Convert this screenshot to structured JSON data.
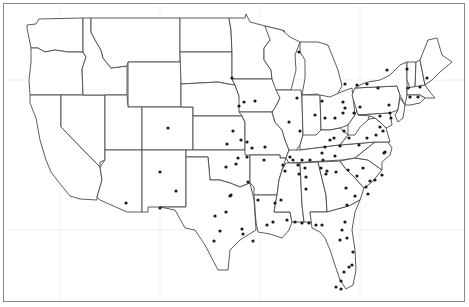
{
  "map": {
    "title": "",
    "region": "Contiguous United States",
    "frame_color": "#8a8a8a",
    "border_color": "#4a4a4a",
    "dot_color": "#1a1a1a",
    "background": "#ffffff",
    "dots": [
      [
        232,
        78
      ],
      [
        244,
        102
      ],
      [
        255,
        101
      ],
      [
        239,
        106
      ],
      [
        233,
        131
      ],
      [
        227,
        144
      ],
      [
        168,
        128
      ],
      [
        241,
        140
      ],
      [
        238,
        158
      ],
      [
        247,
        157
      ],
      [
        236,
        164
      ],
      [
        247,
        142
      ],
      [
        264,
        160
      ],
      [
        299,
        52
      ],
      [
        297,
        98
      ],
      [
        300,
        131
      ],
      [
        289,
        122
      ],
      [
        322,
        101
      ],
      [
        315,
        115
      ],
      [
        325,
        118
      ],
      [
        335,
        118
      ],
      [
        345,
        84
      ],
      [
        357,
        85
      ],
      [
        367,
        84
      ],
      [
        387,
        70
      ],
      [
        378,
        88
      ],
      [
        407,
        69
      ],
      [
        408,
        88
      ],
      [
        420,
        87
      ],
      [
        427,
        78
      ],
      [
        410,
        97
      ],
      [
        418,
        97
      ],
      [
        389,
        105
      ],
      [
        390,
        113
      ],
      [
        380,
        116
      ],
      [
        391,
        118
      ],
      [
        360,
        107
      ],
      [
        343,
        102
      ],
      [
        345,
        108
      ],
      [
        354,
        113
      ],
      [
        330,
        140
      ],
      [
        334,
        138
      ],
      [
        325,
        147
      ],
      [
        322,
        153
      ],
      [
        335,
        156
      ],
      [
        340,
        146
      ],
      [
        344,
        131
      ],
      [
        343,
        113
      ],
      [
        349,
        138
      ],
      [
        359,
        145
      ],
      [
        367,
        138
      ],
      [
        376,
        135
      ],
      [
        380,
        127
      ],
      [
        383,
        131
      ],
      [
        385,
        152
      ],
      [
        384,
        153
      ],
      [
        323,
        160
      ],
      [
        310,
        160
      ],
      [
        302,
        160
      ],
      [
        293,
        160
      ],
      [
        305,
        168
      ],
      [
        321,
        168
      ],
      [
        327,
        171
      ],
      [
        336,
        172
      ],
      [
        348,
        170
      ],
      [
        357,
        176
      ],
      [
        363,
        168
      ],
      [
        375,
        180
      ],
      [
        382,
        175
      ],
      [
        366,
        187
      ],
      [
        355,
        196
      ],
      [
        346,
        188
      ],
      [
        347,
        205
      ],
      [
        368,
        194
      ],
      [
        370,
        181
      ],
      [
        285,
        171
      ],
      [
        299,
        174
      ],
      [
        306,
        177
      ],
      [
        306,
        189
      ],
      [
        281,
        200
      ],
      [
        275,
        203
      ],
      [
        267,
        225
      ],
      [
        273,
        222
      ],
      [
        287,
        220
      ],
      [
        295,
        222
      ],
      [
        302,
        223
      ],
      [
        309,
        223
      ],
      [
        316,
        225
      ],
      [
        322,
        225
      ],
      [
        345,
        222
      ],
      [
        342,
        230
      ],
      [
        340,
        240
      ],
      [
        347,
        238
      ],
      [
        353,
        252
      ],
      [
        352,
        265
      ],
      [
        344,
        272
      ],
      [
        341,
        281
      ],
      [
        349,
        267
      ],
      [
        336,
        287
      ],
      [
        341,
        289
      ],
      [
        283,
        165
      ],
      [
        298,
        165
      ],
      [
        290,
        157
      ],
      [
        248,
        182
      ],
      [
        226,
        167
      ],
      [
        231,
        195
      ],
      [
        230,
        196
      ],
      [
        220,
        231
      ],
      [
        242,
        229
      ],
      [
        243,
        234
      ],
      [
        214,
        241
      ],
      [
        160,
        172
      ],
      [
        160,
        208
      ],
      [
        176,
        191
      ],
      [
        126,
        203
      ],
      [
        253,
        241
      ],
      [
        226,
        212
      ],
      [
        215,
        216
      ],
      [
        258,
        200
      ],
      [
        252,
        148
      ],
      [
        265,
        147
      ],
      [
        326,
        174
      ]
    ]
  }
}
